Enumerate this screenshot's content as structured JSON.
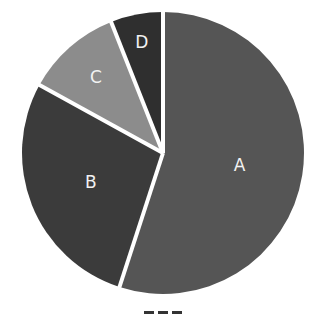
{
  "chart_data": {
    "type": "pie",
    "title": "",
    "categories": [
      "A",
      "B",
      "C",
      "D"
    ],
    "values": [
      55,
      28,
      11,
      6
    ],
    "colors": [
      "#555555",
      "#3b3b3b",
      "#8c8c8c",
      "#2f2f2f"
    ],
    "start_angle_deg": 0,
    "direction": "clockwise",
    "labels_inside": true,
    "label_color": "#f2f2f2",
    "slice_separator_color": "#ffffff",
    "legend": "none",
    "title_note": "title text clipped at bottom edge, not legible"
  }
}
